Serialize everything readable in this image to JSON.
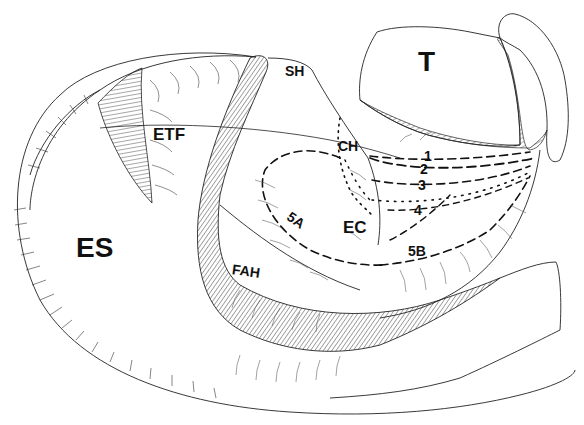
{
  "figure": {
    "type": "anatomical line drawing",
    "background": "#ffffff",
    "ink": "#111111",
    "labels": [
      {
        "id": "ES",
        "text": "ES",
        "x": 76,
        "y": 234,
        "size": "big"
      },
      {
        "id": "T",
        "text": "T",
        "x": 418,
        "y": 48,
        "size": "big"
      },
      {
        "id": "ETF",
        "text": "ETF",
        "x": 153,
        "y": 126,
        "size": "med"
      },
      {
        "id": "SH",
        "text": "SH",
        "x": 285,
        "y": 64,
        "size": "sm"
      },
      {
        "id": "CH",
        "text": "CH",
        "x": 338,
        "y": 139,
        "size": "sm"
      },
      {
        "id": "EC",
        "text": "EC",
        "x": 343,
        "y": 219,
        "size": "med"
      },
      {
        "id": "FAH",
        "text": "FAH",
        "x": 232,
        "y": 264,
        "size": "sm"
      },
      {
        "id": "5A",
        "text": "5A",
        "x": 287,
        "y": 213,
        "size": "sm"
      },
      {
        "id": "5B",
        "text": "5B",
        "x": 408,
        "y": 244,
        "size": "sm"
      },
      {
        "id": "1",
        "text": "1",
        "x": 424,
        "y": 149,
        "size": "sm"
      },
      {
        "id": "2",
        "text": "2",
        "x": 420,
        "y": 162,
        "size": "sm"
      },
      {
        "id": "3",
        "text": "3",
        "x": 418,
        "y": 178,
        "size": "sm"
      },
      {
        "id": "4",
        "text": "4",
        "x": 414,
        "y": 203,
        "size": "sm"
      }
    ],
    "trajectories": [
      {
        "id": "1",
        "style": "dashed",
        "from": "CH",
        "to": "T base"
      },
      {
        "id": "2",
        "style": "dashed",
        "from": "CH",
        "to": "T base"
      },
      {
        "id": "3",
        "style": "dashed",
        "from": "CH",
        "to": "T base"
      },
      {
        "id": "4",
        "style": "dotted",
        "from": "CH",
        "to": "T base"
      },
      {
        "id": "5A",
        "style": "dashed",
        "region": "loop around EC (left)"
      },
      {
        "id": "5B",
        "style": "dashed",
        "region": "loop around EC (right)"
      }
    ]
  }
}
